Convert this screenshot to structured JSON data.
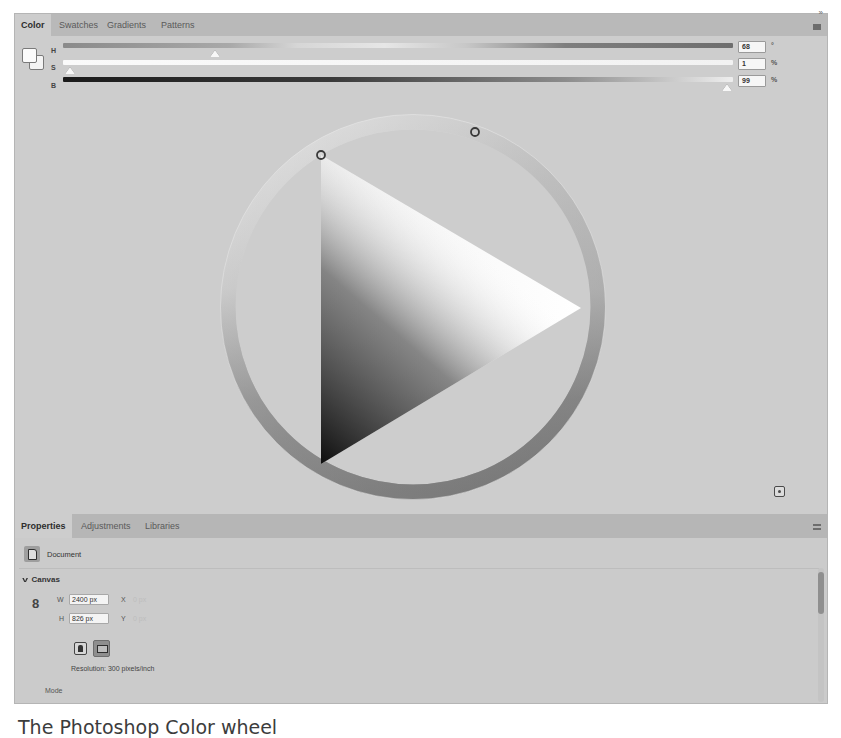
{
  "color_panel": {
    "tabs": [
      {
        "label": "Color",
        "active": true
      },
      {
        "label": "Swatches",
        "active": false
      },
      {
        "label": "Gradients",
        "active": false
      },
      {
        "label": "Patterns",
        "active": false
      }
    ],
    "collapse_glyph": "»",
    "foreground_color": "#fbfbfb",
    "background_color": "#f4f4f4",
    "sliders": [
      {
        "label": "H",
        "value": "68",
        "unit": "°"
      },
      {
        "label": "S",
        "value": "1",
        "unit": "%"
      },
      {
        "label": "B",
        "value": "99",
        "unit": "%"
      }
    ],
    "wheel": {
      "hue_handle": "hue-ring-handle",
      "triangle_handle": "saturation-brightness-handle"
    }
  },
  "properties_panel": {
    "tabs": [
      {
        "label": "Properties",
        "active": true
      },
      {
        "label": "Adjustments",
        "active": false
      },
      {
        "label": "Libraries",
        "active": false
      }
    ],
    "document_label": "Document",
    "canvas_section": {
      "title": "Canvas",
      "width_label": "W",
      "width_value": "2400 px",
      "height_label": "H",
      "height_value": "826 px",
      "x_label": "X",
      "x_placeholder": "0 px",
      "y_label": "Y",
      "y_placeholder": "0 px",
      "resolution": "Resolution: 300 pixels/inch",
      "mode_label": "Mode"
    }
  },
  "caption": "The Photoshop Color wheel"
}
